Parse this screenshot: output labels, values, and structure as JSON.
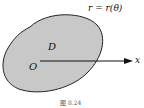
{
  "diagram": {
    "curve_label": "r = r(θ)",
    "region_label": "D",
    "origin_label": "O",
    "axis_label": "x",
    "caption": "图 8.24",
    "colors": {
      "region_fill": "#c8c8c8",
      "outline": "#222222",
      "arrow": "#111111"
    }
  }
}
